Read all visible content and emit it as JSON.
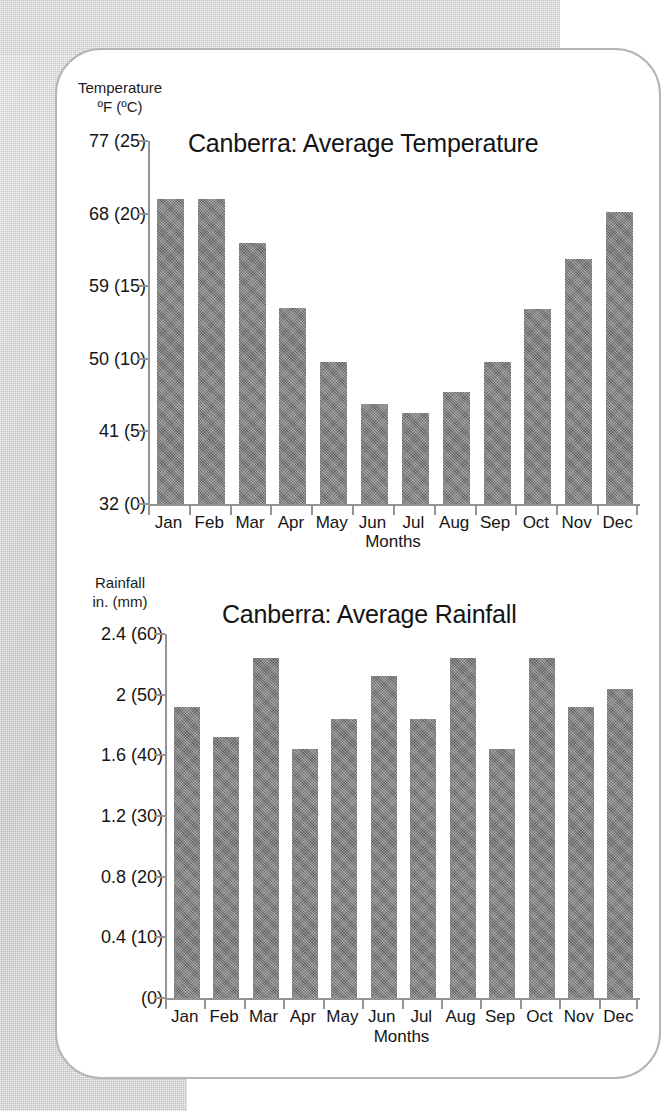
{
  "page": {
    "background_color": "#cfcfcf",
    "card_color": "#ffffff",
    "bar_color": "#7d7d7d",
    "axis_color": "#949494"
  },
  "charts": [
    {
      "id": "temperature",
      "title": "Canberra: Average Temperature",
      "yaxis_header_line1": "Temperature",
      "yaxis_header_line2": "ºF (ºC)",
      "xlabel": "Months",
      "ytick_labels": [
        "77 (25)",
        "68 (20)",
        "59 (15)",
        "50 (10)",
        "41 (5)",
        "32 (0)"
      ],
      "ytick_values": [
        25,
        20,
        15,
        10,
        5,
        0
      ]
    },
    {
      "id": "rainfall",
      "title": "Canberra: Average Rainfall",
      "yaxis_header_line1": "Rainfall",
      "yaxis_header_line2": "in. (mm)",
      "xlabel": "Months",
      "ytick_labels": [
        "2.4 (60)",
        "2 (50)",
        "1.6 (40)",
        "1.2 (30)",
        "0.8 (20)",
        "0.4 (10)",
        "(0)"
      ],
      "ytick_values": [
        60,
        50,
        40,
        30,
        20,
        10,
        0
      ]
    }
  ],
  "chart_data": [
    {
      "type": "bar",
      "title": "Canberra: Average Temperature",
      "xlabel": "Months",
      "ylabel": "Temperature ºF (ºC)",
      "categories": [
        "Jan",
        "Feb",
        "Mar",
        "Apr",
        "May",
        "Jun",
        "Jul",
        "Aug",
        "Sep",
        "Oct",
        "Nov",
        "Dec"
      ],
      "values": [
        21.0,
        21.0,
        18.0,
        13.5,
        9.8,
        6.9,
        6.3,
        7.7,
        9.8,
        13.4,
        16.9,
        20.1
      ],
      "values_fahrenheit": [
        69.8,
        69.8,
        64.4,
        56.3,
        49.6,
        44.4,
        43.3,
        45.9,
        49.6,
        56.1,
        62.4,
        68.2
      ],
      "unit": "°C",
      "ylim": [
        0,
        25
      ],
      "ytick_values": [
        0,
        5,
        10,
        15,
        20,
        25
      ],
      "ytick_labels": [
        "32 (0)",
        "41 (5)",
        "50 (10)",
        "59 (15)",
        "68 (20)",
        "77 (25)"
      ],
      "grid": false,
      "legend": false
    },
    {
      "type": "bar",
      "title": "Canberra: Average Rainfall",
      "xlabel": "Months",
      "ylabel": "Rainfall in. (mm)",
      "categories": [
        "Jan",
        "Feb",
        "Mar",
        "Apr",
        "May",
        "Jun",
        "Jul",
        "Aug",
        "Sep",
        "Oct",
        "Nov",
        "Dec"
      ],
      "values": [
        48,
        43,
        56,
        41,
        46,
        53,
        46,
        56,
        41,
        56,
        48,
        51
      ],
      "values_inches": [
        1.9,
        1.7,
        2.2,
        1.6,
        1.8,
        2.1,
        1.8,
        2.2,
        1.6,
        2.2,
        1.9,
        2.0
      ],
      "unit": "mm",
      "ylim": [
        0,
        60
      ],
      "ytick_values": [
        0,
        10,
        20,
        30,
        40,
        50,
        60
      ],
      "ytick_labels": [
        "(0)",
        "0.4 (10)",
        "0.8 (20)",
        "1.2 (30)",
        "1.6 (40)",
        "2 (50)",
        "2.4 (60)"
      ],
      "grid": false,
      "legend": false
    }
  ]
}
